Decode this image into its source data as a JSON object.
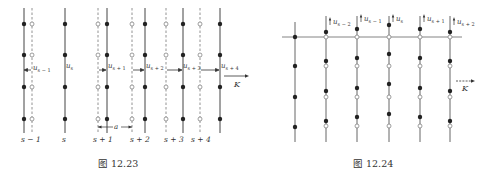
{
  "figures": [
    {
      "id": "fig-12-23",
      "caption": "图 12.23",
      "description": "Longitudinal wave: planes of atoms displaced horizontally from equilibrium (dashed lines = equilibrium, solid lines = displaced)",
      "plane_labels": [
        "s − 1",
        "s",
        "s + 1",
        "s + 2",
        "s + 3",
        "s + 4"
      ],
      "displacement_labels": [
        "u",
        "u",
        "u",
        "u",
        "u",
        "u"
      ],
      "displacement_subscripts": [
        "s − 1",
        "s",
        "s + 1",
        "s + 2",
        "s + 3",
        "s + 4"
      ],
      "spacing_label": "a",
      "wavevector_label": "K"
    },
    {
      "id": "fig-12-24",
      "caption": "图 12.24",
      "description": "Transverse wave: planes of atoms displaced vertically (open circles = equilibrium, filled = displaced)",
      "displacement_labels": [
        "u",
        "u",
        "u",
        "u",
        "u"
      ],
      "displacement_subscripts": [
        "s − 2",
        "s − 1",
        "s",
        "s + 1",
        "s + 2"
      ],
      "wavevector_label": "K"
    }
  ],
  "colors": {
    "line": "#444444",
    "dashed": "#777777",
    "dot": "#222222",
    "text": "#333333"
  }
}
